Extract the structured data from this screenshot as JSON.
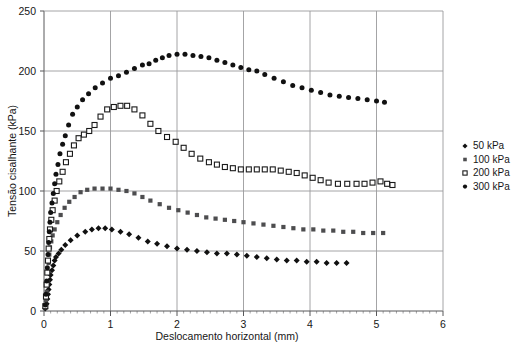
{
  "chart_data": {
    "type": "scatter",
    "title": "",
    "xlabel": "Deslocamento horizontal (mm)",
    "ylabel": "Tensão cisalhante (kPa)",
    "xlim": [
      0,
      6
    ],
    "ylim": [
      0,
      250
    ],
    "xticks": [
      0,
      1,
      2,
      3,
      4,
      5,
      6
    ],
    "yticks": [
      0,
      50,
      100,
      150,
      200,
      250
    ],
    "xtick_labels": [
      "0",
      "1",
      "2",
      "3",
      "4",
      "5",
      "6"
    ],
    "ytick_labels": [
      "0",
      "50",
      "100",
      "150",
      "200",
      "250"
    ],
    "x_minor_tick_step": 0.1,
    "grid": "major-xy",
    "legend_position": "right-middle",
    "series": [
      {
        "name": "50 kPa",
        "marker": "filled-diamond",
        "color": "#111111",
        "points": [
          [
            0.02,
            2
          ],
          [
            0.04,
            6
          ],
          [
            0.05,
            10
          ],
          [
            0.06,
            14
          ],
          [
            0.07,
            18
          ],
          [
            0.08,
            22
          ],
          [
            0.09,
            26
          ],
          [
            0.1,
            30
          ],
          [
            0.12,
            34
          ],
          [
            0.14,
            38
          ],
          [
            0.16,
            42
          ],
          [
            0.18,
            45
          ],
          [
            0.22,
            48
          ],
          [
            0.26,
            51
          ],
          [
            0.32,
            55
          ],
          [
            0.4,
            59
          ],
          [
            0.5,
            63
          ],
          [
            0.62,
            66
          ],
          [
            0.72,
            68
          ],
          [
            0.82,
            69
          ],
          [
            0.92,
            69
          ],
          [
            1.02,
            68
          ],
          [
            1.15,
            66
          ],
          [
            1.28,
            64
          ],
          [
            1.42,
            61
          ],
          [
            1.56,
            58
          ],
          [
            1.7,
            56
          ],
          [
            1.85,
            54
          ],
          [
            2.0,
            52
          ],
          [
            2.15,
            51
          ],
          [
            2.3,
            50
          ],
          [
            2.45,
            49
          ],
          [
            2.6,
            48
          ],
          [
            2.75,
            48
          ],
          [
            2.9,
            47
          ],
          [
            3.05,
            46
          ],
          [
            3.2,
            45
          ],
          [
            3.35,
            44
          ],
          [
            3.5,
            43
          ],
          [
            3.65,
            42
          ],
          [
            3.8,
            42
          ],
          [
            3.95,
            41
          ],
          [
            4.1,
            41
          ],
          [
            4.25,
            40
          ],
          [
            4.4,
            40
          ],
          [
            4.55,
            40
          ]
        ]
      },
      {
        "name": "100 kPa",
        "marker": "filled-square",
        "color": "#4d4d4f",
        "points": [
          [
            0.02,
            3
          ],
          [
            0.03,
            9
          ],
          [
            0.04,
            16
          ],
          [
            0.05,
            24
          ],
          [
            0.06,
            32
          ],
          [
            0.07,
            40
          ],
          [
            0.08,
            47
          ],
          [
            0.09,
            53
          ],
          [
            0.11,
            58
          ],
          [
            0.13,
            63
          ],
          [
            0.16,
            68
          ],
          [
            0.2,
            74
          ],
          [
            0.25,
            80
          ],
          [
            0.31,
            86
          ],
          [
            0.38,
            91
          ],
          [
            0.46,
            95
          ],
          [
            0.55,
            99
          ],
          [
            0.65,
            101
          ],
          [
            0.76,
            102
          ],
          [
            0.88,
            102
          ],
          [
            1.0,
            102
          ],
          [
            1.12,
            101
          ],
          [
            1.24,
            100
          ],
          [
            1.36,
            98
          ],
          [
            1.48,
            95
          ],
          [
            1.6,
            92
          ],
          [
            1.74,
            89
          ],
          [
            1.88,
            86
          ],
          [
            2.02,
            84
          ],
          [
            2.16,
            82
          ],
          [
            2.3,
            80
          ],
          [
            2.44,
            78
          ],
          [
            2.58,
            77
          ],
          [
            2.72,
            76
          ],
          [
            2.86,
            75
          ],
          [
            3.0,
            74
          ],
          [
            3.15,
            73
          ],
          [
            3.3,
            72
          ],
          [
            3.45,
            71
          ],
          [
            3.6,
            70
          ],
          [
            3.75,
            69
          ],
          [
            3.9,
            68
          ],
          [
            4.05,
            68
          ],
          [
            4.2,
            67
          ],
          [
            4.35,
            67
          ],
          [
            4.5,
            66
          ],
          [
            4.65,
            66
          ],
          [
            4.8,
            65
          ],
          [
            4.95,
            65
          ],
          [
            5.1,
            65
          ]
        ]
      },
      {
        "name": "200 kPa",
        "marker": "open-square",
        "color": "#1a1a1a",
        "points": [
          [
            0.02,
            4
          ],
          [
            0.03,
            12
          ],
          [
            0.04,
            22
          ],
          [
            0.05,
            32
          ],
          [
            0.06,
            42
          ],
          [
            0.07,
            52
          ],
          [
            0.08,
            60
          ],
          [
            0.09,
            68
          ],
          [
            0.11,
            76
          ],
          [
            0.13,
            84
          ],
          [
            0.16,
            92
          ],
          [
            0.19,
            100
          ],
          [
            0.23,
            108
          ],
          [
            0.28,
            116
          ],
          [
            0.33,
            124
          ],
          [
            0.39,
            131
          ],
          [
            0.45,
            138
          ],
          [
            0.52,
            144
          ],
          [
            0.6,
            147
          ],
          [
            0.68,
            150
          ],
          [
            0.76,
            155
          ],
          [
            0.85,
            162
          ],
          [
            0.95,
            168
          ],
          [
            1.05,
            170
          ],
          [
            1.15,
            171
          ],
          [
            1.25,
            171
          ],
          [
            1.36,
            168
          ],
          [
            1.48,
            163
          ],
          [
            1.6,
            156
          ],
          [
            1.72,
            150
          ],
          [
            1.85,
            145
          ],
          [
            1.98,
            141
          ],
          [
            2.1,
            136
          ],
          [
            2.22,
            131
          ],
          [
            2.35,
            127
          ],
          [
            2.48,
            124
          ],
          [
            2.6,
            122
          ],
          [
            2.72,
            120
          ],
          [
            2.84,
            119
          ],
          [
            2.96,
            118
          ],
          [
            3.08,
            118
          ],
          [
            3.2,
            118
          ],
          [
            3.32,
            118
          ],
          [
            3.44,
            118
          ],
          [
            3.56,
            117
          ],
          [
            3.68,
            116
          ],
          [
            3.8,
            115
          ],
          [
            3.92,
            113
          ],
          [
            4.04,
            111
          ],
          [
            4.16,
            109
          ],
          [
            4.28,
            107
          ],
          [
            4.42,
            106
          ],
          [
            4.56,
            106
          ],
          [
            4.7,
            106
          ],
          [
            4.82,
            106
          ],
          [
            4.94,
            107
          ],
          [
            5.06,
            108
          ],
          [
            5.16,
            106
          ],
          [
            5.24,
            105
          ]
        ]
      },
      {
        "name": "300 kPa",
        "marker": "filled-circle",
        "color": "#111111",
        "points": [
          [
            0.02,
            5
          ],
          [
            0.03,
            14
          ],
          [
            0.04,
            25
          ],
          [
            0.05,
            36
          ],
          [
            0.06,
            47
          ],
          [
            0.07,
            57
          ],
          [
            0.08,
            66
          ],
          [
            0.09,
            74
          ],
          [
            0.1,
            82
          ],
          [
            0.12,
            90
          ],
          [
            0.14,
            98
          ],
          [
            0.16,
            106
          ],
          [
            0.18,
            114
          ],
          [
            0.21,
            122
          ],
          [
            0.24,
            131
          ],
          [
            0.28,
            139
          ],
          [
            0.32,
            146
          ],
          [
            0.37,
            155
          ],
          [
            0.43,
            164
          ],
          [
            0.5,
            170
          ],
          [
            0.58,
            176
          ],
          [
            0.67,
            181
          ],
          [
            0.77,
            186
          ],
          [
            0.88,
            190
          ],
          [
            1.0,
            194
          ],
          [
            1.12,
            196
          ],
          [
            1.24,
            199
          ],
          [
            1.36,
            202
          ],
          [
            1.48,
            205
          ],
          [
            1.58,
            206
          ],
          [
            1.68,
            209
          ],
          [
            1.78,
            211
          ],
          [
            1.88,
            213
          ],
          [
            2.0,
            214
          ],
          [
            2.12,
            214
          ],
          [
            2.24,
            213
          ],
          [
            2.36,
            212
          ],
          [
            2.48,
            211
          ],
          [
            2.6,
            209
          ],
          [
            2.72,
            207
          ],
          [
            2.84,
            205
          ],
          [
            2.96,
            203
          ],
          [
            3.08,
            201
          ],
          [
            3.2,
            200
          ],
          [
            3.32,
            197
          ],
          [
            3.46,
            194
          ],
          [
            3.6,
            191
          ],
          [
            3.74,
            188
          ],
          [
            3.88,
            186
          ],
          [
            4.02,
            184
          ],
          [
            4.16,
            182
          ],
          [
            4.3,
            180
          ],
          [
            4.44,
            179
          ],
          [
            4.58,
            178
          ],
          [
            4.72,
            177
          ],
          [
            4.86,
            176
          ],
          [
            5.0,
            175
          ],
          [
            5.12,
            174
          ]
        ]
      }
    ],
    "legend": [
      {
        "label": "50 kPa",
        "marker": "filled-diamond"
      },
      {
        "label": "100 kPa",
        "marker": "filled-square"
      },
      {
        "label": "200 kPa",
        "marker": "open-square"
      },
      {
        "label": "300 kPa",
        "marker": "filled-circle"
      }
    ]
  }
}
